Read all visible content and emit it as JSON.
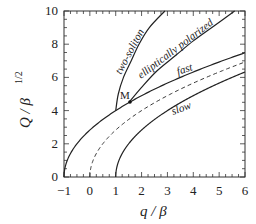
{
  "chart_data": {
    "type": "line",
    "title": "",
    "xlabel": "q / β",
    "ylabel": "Q / β^1/2",
    "xlim": [
      -1,
      6
    ],
    "ylim": [
      0,
      10
    ],
    "x_ticks": [
      "-1",
      "0",
      "1",
      "2",
      "3",
      "4",
      "5",
      "6"
    ],
    "y_ticks": [
      "0",
      "2",
      "4",
      "6",
      "8",
      "10"
    ],
    "grid": false,
    "legend": "none (inline curve labels)",
    "series": [
      {
        "name": "fast",
        "style": "solid",
        "x": [
          -1,
          -0.5,
          0,
          1,
          1.5,
          2,
          3,
          4,
          5,
          6
        ],
        "y": [
          0,
          2.0,
          2.83,
          4.0,
          4.47,
          4.9,
          5.66,
          6.32,
          6.93,
          7.48
        ]
      },
      {
        "name": "dashed (unlabeled)",
        "style": "dashed",
        "x": [
          0,
          0.5,
          1,
          2,
          3,
          4,
          5,
          6
        ],
        "y": [
          0,
          2.0,
          2.83,
          4.0,
          4.9,
          5.66,
          6.32,
          6.93
        ]
      },
      {
        "name": "slow",
        "style": "solid",
        "x": [
          1,
          1.5,
          2,
          3,
          4,
          5,
          6
        ],
        "y": [
          0,
          2.0,
          2.83,
          4.0,
          4.9,
          5.66,
          6.32
        ]
      },
      {
        "name": "two-soliton",
        "style": "solid",
        "x": [
          1.0,
          1.1,
          1.3,
          1.6,
          1.9,
          2.3,
          2.9
        ],
        "y": [
          4.0,
          5.0,
          6.0,
          7.0,
          8.0,
          9.0,
          10.0
        ]
      },
      {
        "name": "elliptically polarized",
        "style": "solid",
        "x": [
          1.5,
          2.0,
          2.6,
          3.3,
          4.0,
          4.8,
          5.6
        ],
        "y": [
          4.47,
          5.4,
          6.4,
          7.3,
          8.2,
          9.1,
          10.0
        ]
      }
    ],
    "annotations": [
      {
        "text": "M",
        "x": 1.5,
        "y": 4.47,
        "marker": "dot"
      },
      {
        "text": "two-soliton"
      },
      {
        "text": "elliptically polarized"
      },
      {
        "text": "fast"
      },
      {
        "text": "slow"
      }
    ]
  },
  "labels": {
    "x_axis": "q / β",
    "y_axis_main": "Q / β",
    "y_axis_sup": "1/2",
    "point": "M",
    "two_soliton": "two-soliton",
    "elliptic": "elliptically polarized",
    "fast": "fast",
    "slow": "slow",
    "xt": [
      "−1",
      "0",
      "1",
      "2",
      "3",
      "4",
      "5",
      "6"
    ],
    "yt": [
      "0",
      "2",
      "4",
      "6",
      "8",
      "10"
    ]
  }
}
